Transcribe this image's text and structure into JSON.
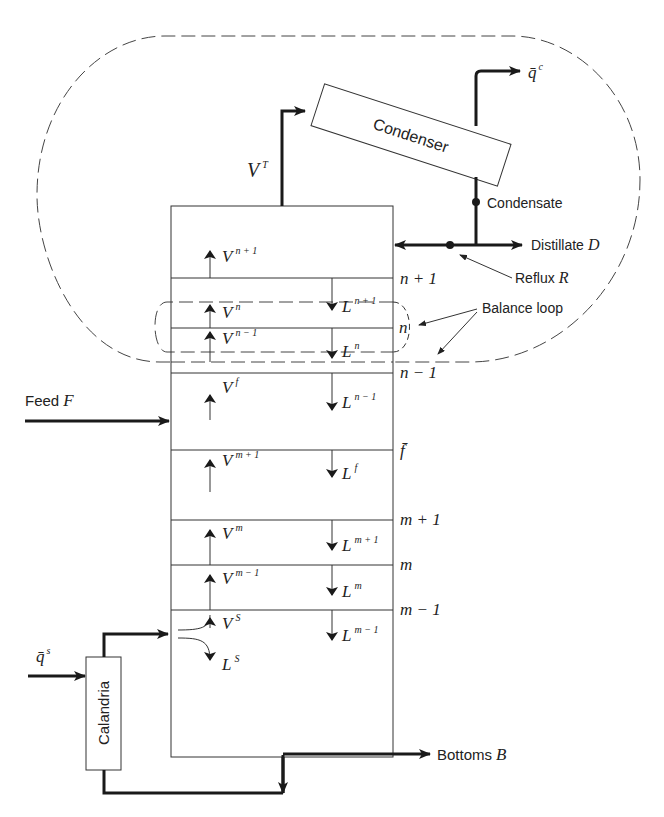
{
  "diagram": {
    "colors": {
      "line": "#1a1a1a",
      "background": "#ffffff",
      "dashed": "#444444"
    },
    "units": {
      "condenser": {
        "label": "Condenser"
      },
      "calandria": {
        "label": "Calandria"
      },
      "column": {
        "label": "Column"
      }
    },
    "streams": {
      "vapor_top": {
        "base": "V",
        "sup": "T"
      },
      "condenser_duty": {
        "base": "q̄",
        "sup": "c"
      },
      "reboiler_duty": {
        "base": "q̄",
        "sup": "s"
      },
      "condensate": {
        "label": "Condensate"
      },
      "distillate": {
        "label": "Distillate",
        "symbol": "D"
      },
      "reflux": {
        "label": "Reflux",
        "symbol": "R"
      },
      "feed": {
        "label": "Feed",
        "symbol": "F"
      },
      "bottoms": {
        "label": "Bottoms",
        "symbol": "B"
      },
      "balance_loop": {
        "label": "Balance loop"
      }
    },
    "vapor_flows": [
      {
        "base": "V",
        "sup": "n + 1"
      },
      {
        "base": "V",
        "sup": "n"
      },
      {
        "base": "V",
        "sup": "n − 1"
      },
      {
        "base": "V",
        "sup": "f"
      },
      {
        "base": "V",
        "sup": "m + 1"
      },
      {
        "base": "V",
        "sup": "m"
      },
      {
        "base": "V",
        "sup": "m − 1"
      },
      {
        "base": "V",
        "sup": "S"
      }
    ],
    "liquid_flows": [
      {
        "base": "L",
        "sup": "n + 1"
      },
      {
        "base": "L",
        "sup": "n"
      },
      {
        "base": "L",
        "sup": "n − 1"
      },
      {
        "base": "L",
        "sup": "f"
      },
      {
        "base": "L",
        "sup": "m + 1"
      },
      {
        "base": "L",
        "sup": "m"
      },
      {
        "base": "L",
        "sup": "m − 1"
      },
      {
        "base": "L",
        "sup": "S"
      }
    ],
    "stage_labels": {
      "n_plus_1": "n + 1",
      "n": "n",
      "n_minus_1": "n − 1",
      "f": "f̄",
      "m_plus_1": "m + 1",
      "m": "m",
      "m_minus_1": "m − 1"
    }
  }
}
